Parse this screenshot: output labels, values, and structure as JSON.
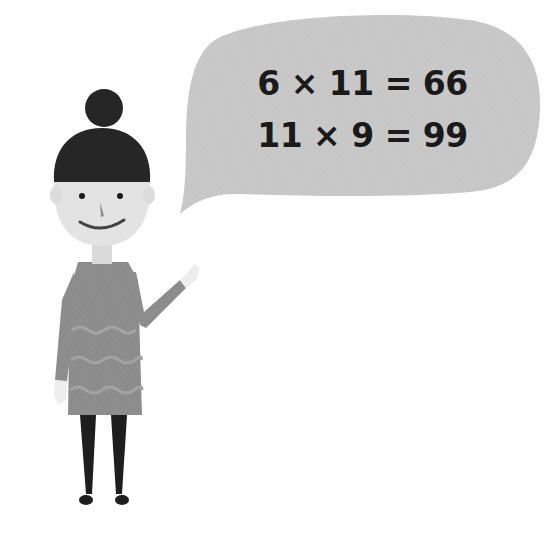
{
  "speech_bubble": {
    "lines": [
      "6 × 11 = 66",
      "11 × 9 = 99"
    ]
  },
  "colors": {
    "bubble": "#c9c9c9",
    "hair": "#262626",
    "skin": "#e3e3e3",
    "dress": "#8e8e8e",
    "legs": "#1e1e1e",
    "text": "#1a1a1a"
  }
}
